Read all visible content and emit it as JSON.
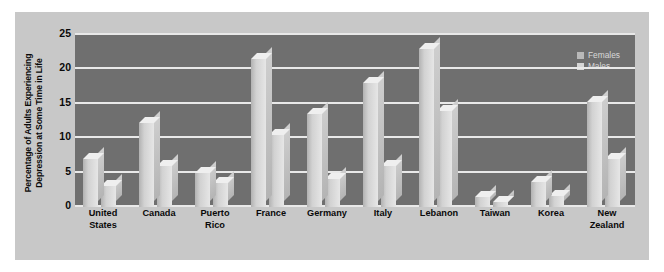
{
  "chart_data": {
    "type": "bar",
    "title": "",
    "xlabel": "",
    "ylabel": "Percentage of Adults Experiencing Depression at Some Time in Life",
    "ylabel_lines": [
      "Percentage of Adults Experiencing",
      "Depression at Some Time in Life"
    ],
    "categories": [
      "United States",
      "Canada",
      "Puerto Rico",
      "France",
      "Germany",
      "Italy",
      "Lebanon",
      "Taiwan",
      "Korea",
      "New Zealand"
    ],
    "category_lines": [
      [
        "United",
        "States"
      ],
      [
        "Canada"
      ],
      [
        "Puerto",
        "Rico"
      ],
      [
        "France"
      ],
      [
        "Germany"
      ],
      [
        "Italy"
      ],
      [
        "Lebanon"
      ],
      [
        "Taiwan"
      ],
      [
        "Korea"
      ],
      [
        "New",
        "Zealand"
      ]
    ],
    "series": [
      {
        "name": "Females",
        "values": [
          7.0,
          12.2,
          5.0,
          21.5,
          13.5,
          18.0,
          23.0,
          1.5,
          3.6,
          15.3
        ]
      },
      {
        "name": "Males",
        "values": [
          3.0,
          6.0,
          3.5,
          10.5,
          4.0,
          6.0,
          14.0,
          0.8,
          1.6,
          7.0
        ]
      }
    ],
    "ylim": [
      0,
      25
    ],
    "yticks": [
      0,
      5,
      10,
      15,
      20,
      25
    ],
    "ytick_labels": [
      "0",
      "5",
      "10",
      "15",
      "20",
      "25"
    ],
    "grid": true,
    "legend_position": "top-right",
    "colors": {
      "plot_background": "#6f6f6f",
      "figure_background": "#c8c8c8",
      "gridline": "#e9e9e9",
      "bar_females": "#d2d2d2",
      "bar_males": "#d2d2d2",
      "text": "#0a0a0a",
      "legend_text": "#d8d8d8"
    }
  }
}
